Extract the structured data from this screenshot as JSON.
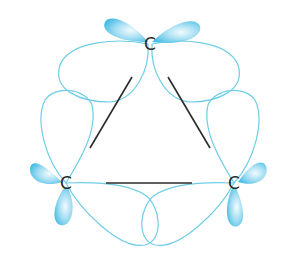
{
  "diagram": {
    "atoms": [
      {
        "id": "top",
        "label": "C",
        "x": 150,
        "y": 44
      },
      {
        "id": "left",
        "label": "C",
        "x": 66,
        "y": 183
      },
      {
        "id": "right",
        "label": "C",
        "x": 234,
        "y": 183
      }
    ],
    "bonds": [
      {
        "from": "top",
        "to": "left"
      },
      {
        "from": "top",
        "to": "right"
      },
      {
        "from": "left",
        "to": "right"
      }
    ],
    "colors": {
      "orbital_outline": "#6fcde6",
      "orbital_fill_dark": "#4cc0e6",
      "orbital_fill_light": "#e6f7fc",
      "bond": "#2b2b2b",
      "label": "#2a2a2a"
    }
  }
}
